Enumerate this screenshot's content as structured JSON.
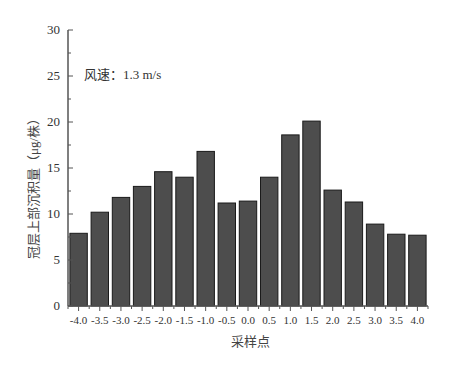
{
  "chart_data": {
    "type": "bar",
    "title": "",
    "annotation": "风速：1.3 m/s",
    "xlabel": "采样点",
    "ylabel": "冠层上部沉积量（μg/株）",
    "categories": [
      "-4.0",
      "-3.5",
      "-3.0",
      "-2.5",
      "-2.0",
      "-1.5",
      "-1.0",
      "-0.5",
      "0.0",
      "0.5",
      "1.0",
      "1.5",
      "2.0",
      "2.5",
      "3.0",
      "3.5",
      "4.0"
    ],
    "values": [
      7.9,
      10.2,
      11.8,
      13.0,
      14.6,
      14.0,
      16.8,
      11.2,
      11.4,
      14.0,
      18.6,
      20.1,
      12.6,
      11.3,
      8.9,
      7.8,
      7.7
    ],
    "ylim": [
      0,
      30
    ],
    "yticks": [
      0,
      5,
      10,
      15,
      20,
      25,
      30
    ],
    "grid": false,
    "legend": null,
    "bar_color": "#4d4d4d",
    "bar_edge_color": "#1a1a1a"
  }
}
